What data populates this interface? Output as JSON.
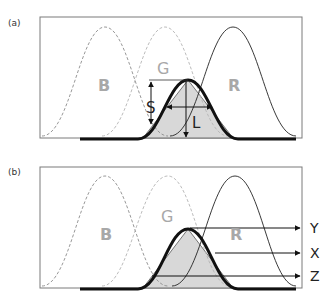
{
  "figure": {
    "panels": [
      {
        "id": "a",
        "label": "(a)",
        "curve_labels": {
          "blue": "B",
          "green": "G",
          "red": "R"
        },
        "dimension_labels": {
          "height": "S",
          "width": "L"
        }
      },
      {
        "id": "b",
        "label": "(b)",
        "curve_labels": {
          "blue": "B",
          "green": "G",
          "red": "R"
        },
        "output_labels": {
          "top": "Y",
          "middle": "X",
          "bottom": "Z"
        }
      }
    ],
    "colors": {
      "frame": "#7a7a7a",
      "blue_curve": "#8c8c8c",
      "green_curve": "#b4b4b4",
      "red_curve": "#222222",
      "bold_curve": "#111111",
      "fill": "#d8d8d8",
      "label_gray": "#a8a8a8"
    }
  }
}
